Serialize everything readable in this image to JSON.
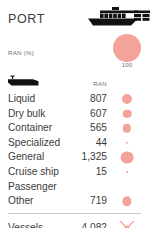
{
  "card": {
    "title": "PORT",
    "ship_icon": "container-ship-icon"
  },
  "legend": {
    "label": "RAN (%)",
    "max_value": "100",
    "bubble_color": "#f4a39b"
  },
  "columns": {
    "category_icon": "vessel-silhouette-icon",
    "value_header": "RAN"
  },
  "rows": [
    {
      "label": "Liquid",
      "value": "807",
      "bubble_px": 10.0
    },
    {
      "label": "Dry bulk",
      "value": "607",
      "bubble_px": 8.6
    },
    {
      "label": "Container",
      "value": "565",
      "bubble_px": 8.3
    },
    {
      "label": "Specialized",
      "value": "44",
      "bubble_px": 2.4
    },
    {
      "label": "General",
      "value": "1,325",
      "bubble_px": 12.8
    },
    {
      "label": "Cruise ship",
      "value": "15",
      "bubble_px": 1.8
    },
    {
      "label": "Passenger",
      "value": "",
      "bubble_px": 0
    },
    {
      "label": "Other",
      "value": "719",
      "bubble_px": 9.3
    }
  ],
  "total": {
    "label": "Vessels",
    "value": "4,082",
    "marker": "starburst-marker-icon"
  },
  "chart_data": {
    "type": "table",
    "title": "PORT",
    "columns": [
      "Vessel type",
      "RAN"
    ],
    "categories": [
      "Liquid",
      "Dry bulk",
      "Container",
      "Specialized",
      "General",
      "Cruise ship",
      "Passenger",
      "Other"
    ],
    "values": [
      807,
      607,
      565,
      44,
      1325,
      15,
      null,
      719
    ],
    "bubble_legend": {
      "label": "RAN (%)",
      "reference_value": 100
    },
    "total": {
      "label": "Vessels",
      "value": 4082
    },
    "accent_color": "#f4a39b"
  }
}
